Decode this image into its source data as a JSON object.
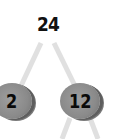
{
  "diagram": {
    "type": "factor-tree",
    "root": {
      "value": "24"
    },
    "children": [
      {
        "value": "2"
      },
      {
        "value": "12"
      }
    ],
    "colors": {
      "node_fill": "#8a8a8a",
      "edge": "#e0e0e0",
      "text": "#111111"
    }
  }
}
